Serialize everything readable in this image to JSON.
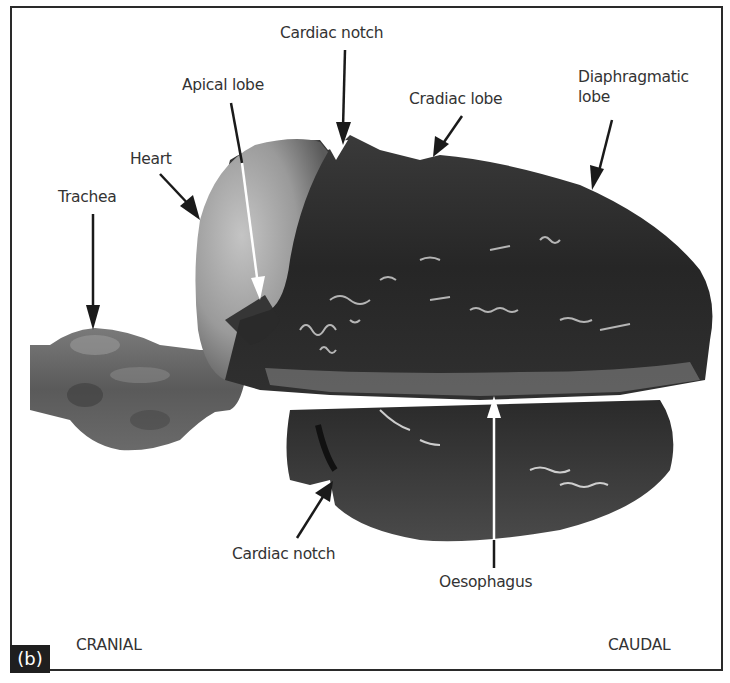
{
  "figure": {
    "panel_label": "(b)",
    "orientation": {
      "left": "CRANIAL",
      "right": "CAUDAL"
    },
    "labels": [
      {
        "id": "trachea",
        "text": "Trachea"
      },
      {
        "id": "heart",
        "text": "Heart"
      },
      {
        "id": "apical-lobe",
        "text": "Apical lobe"
      },
      {
        "id": "cardiac-notch-top",
        "text": "Cardiac notch"
      },
      {
        "id": "cradiac-lobe",
        "text": "Cradiac lobe"
      },
      {
        "id": "diaphragmatic-lobe-line1",
        "text": "Diaphragmatic"
      },
      {
        "id": "diaphragmatic-lobe-line2",
        "text": "lobe"
      },
      {
        "id": "cardiac-notch-bottom",
        "text": "Cardiac notch"
      },
      {
        "id": "oesophagus",
        "text": "Oesophagus"
      }
    ],
    "colors": {
      "border": "#2a2a2a",
      "label_text": "#333333",
      "arrow_dark": "#1a1a1a",
      "arrow_light": "#ffffff",
      "lung_dark": "#2b2b2b",
      "heart_light": "#a9a9a9",
      "trachea": "#5e5e5e"
    }
  }
}
